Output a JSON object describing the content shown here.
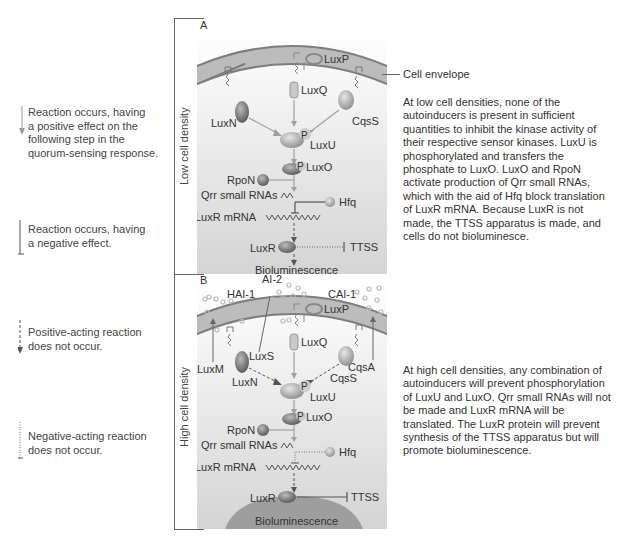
{
  "legend": {
    "items": [
      {
        "type": "positive-occurs",
        "lines": [
          "Reaction occurs, having",
          "a positive effect on the",
          "following step in the",
          "quorum-sensing response."
        ]
      },
      {
        "type": "negative-occurs",
        "lines": [
          "Reaction occurs, having",
          "a negative effect."
        ]
      },
      {
        "type": "positive-not-occurs",
        "lines": [
          "Positive-acting reaction",
          "does not occur."
        ]
      },
      {
        "type": "negative-not-occurs",
        "lines": [
          "Negative-acting reaction",
          "does not occur."
        ]
      }
    ]
  },
  "side_labels": {
    "low": "Low cell density",
    "high": "High cell density"
  },
  "cell_envelope_label": "Cell envelope",
  "panel_a": {
    "letter": "A",
    "labels": {
      "luxp": "LuxP",
      "luxq": "LuxQ",
      "luxn": "LuxN",
      "cqss": "CqsS",
      "luxu": "LuxU",
      "luxo": "LuxO",
      "p": "P",
      "rpon": "RpoN",
      "qrr": "Qrr small RNAs",
      "hfq": "Hfq",
      "luxr_mrna": "LuxR mRNA",
      "luxr": "LuxR",
      "ttss": "TTSS",
      "biolum": "Bioluminescence"
    },
    "description": "At low cell densities, none of the autoinducers is present in sufficient quantities to inhibit the kinase activity of their respective sensor kinases. LuxU is phosphorylated and transfers the phosphate to LuxO. LuxO and RpoN activate production of Qrr small RNAs, which with the aid of Hfq block translation of LuxR mRNA. Because LuxR is not made, the TTSS apparatus is made, and cells do not bioluminesce."
  },
  "panel_b": {
    "letter": "B",
    "labels": {
      "hai1": "HAI-1",
      "ai2": "AI-2",
      "cai1": "CAI-1",
      "luxp": "LuxP",
      "luxs": "LuxS",
      "luxq": "LuxQ",
      "luxm": "LuxM",
      "luxn": "LuxN",
      "cqss": "CqsS",
      "cqsa": "CqsA",
      "luxu": "LuxU",
      "luxo": "LuxO",
      "p": "P",
      "rpon": "RpoN",
      "qrr": "Qrr small RNAs",
      "hfq": "Hfq",
      "luxr_mrna": "LuxR mRNA",
      "luxr": "LuxR",
      "ttss": "TTSS",
      "biolum": "Bioluminescence"
    },
    "description": "At high cell densities, any combination of autoinducers will prevent phosphorylation of LuxU and LuxO. Qrr small RNAs will not be made and LuxR mRNA will be translated. The LuxR protein will prevent synthesis of the TTSS apparatus but will promote bioluminescence."
  },
  "colors": {
    "membrane": "#b9b9b9",
    "membrane_edge": "#8a8a8a",
    "cytoplasm_top": "#ffffff",
    "cytoplasm_bottom": "#d6d6d6",
    "arrow_gray": "#a0a0a0",
    "text": "#333333"
  }
}
